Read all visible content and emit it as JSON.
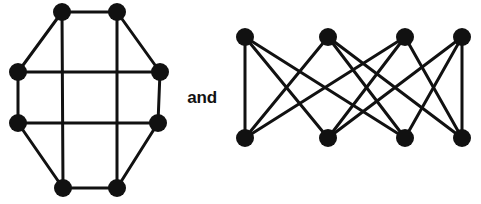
{
  "figure": {
    "caption_text": "and",
    "background_color": "#ffffff",
    "node_color": "#111111",
    "edge_color": "#111111",
    "node_radius": 9,
    "edge_width": 3
  },
  "chart_data": {
    "type": "diagram",
    "title": "",
    "subtitle": "",
    "xlabel": "",
    "ylabel": "",
    "graph_count": 2,
    "connector_label": "and",
    "graphs": [
      {
        "name": "octagon-grid-graph",
        "label": "left-graph",
        "description": "Regular octagon with four internal chords forming a grid; every vertex has degree 3",
        "vertex_count": 8,
        "edge_count": 12,
        "regular_degree": 3,
        "vertices": [
          {
            "id": "v1",
            "x": 62,
            "y": 12
          },
          {
            "id": "v2",
            "x": 117,
            "y": 12
          },
          {
            "id": "v3",
            "x": 160,
            "y": 72
          },
          {
            "id": "v4",
            "x": 158,
            "y": 123
          },
          {
            "id": "v5",
            "x": 117,
            "y": 188
          },
          {
            "id": "v6",
            "x": 63,
            "y": 188
          },
          {
            "id": "v7",
            "x": 18,
            "y": 123
          },
          {
            "id": "v8",
            "x": 18,
            "y": 72
          }
        ],
        "edges": [
          {
            "from": "v1",
            "to": "v2"
          },
          {
            "from": "v2",
            "to": "v3"
          },
          {
            "from": "v3",
            "to": "v4"
          },
          {
            "from": "v4",
            "to": "v5"
          },
          {
            "from": "v5",
            "to": "v6"
          },
          {
            "from": "v6",
            "to": "v7"
          },
          {
            "from": "v7",
            "to": "v8"
          },
          {
            "from": "v8",
            "to": "v1"
          },
          {
            "from": "v8",
            "to": "v3"
          },
          {
            "from": "v7",
            "to": "v4"
          },
          {
            "from": "v1",
            "to": "v6"
          },
          {
            "from": "v2",
            "to": "v5"
          }
        ]
      },
      {
        "name": "bipartite-cubic-graph",
        "label": "right-graph",
        "description": "Bipartite graph on 4 + 4 vertices with crossing edges; every vertex has degree 3",
        "vertex_count": 8,
        "edge_count": 12,
        "regular_degree": 3,
        "vertices": [
          {
            "id": "t1",
            "x": 245,
            "y": 37,
            "part": "top"
          },
          {
            "id": "t2",
            "x": 328,
            "y": 37,
            "part": "top"
          },
          {
            "id": "t3",
            "x": 405,
            "y": 37,
            "part": "top"
          },
          {
            "id": "t4",
            "x": 462,
            "y": 37,
            "part": "top"
          },
          {
            "id": "b1",
            "x": 245,
            "y": 138,
            "part": "bottom"
          },
          {
            "id": "b2",
            "x": 328,
            "y": 138,
            "part": "bottom"
          },
          {
            "id": "b3",
            "x": 405,
            "y": 138,
            "part": "bottom"
          },
          {
            "id": "b4",
            "x": 462,
            "y": 138,
            "part": "bottom"
          }
        ],
        "edges": [
          {
            "from": "t1",
            "to": "b1"
          },
          {
            "from": "t1",
            "to": "b2"
          },
          {
            "from": "t1",
            "to": "b3"
          },
          {
            "from": "t2",
            "to": "b1"
          },
          {
            "from": "t2",
            "to": "b3"
          },
          {
            "from": "t2",
            "to": "b4"
          },
          {
            "from": "t3",
            "to": "b1"
          },
          {
            "from": "t3",
            "to": "b2"
          },
          {
            "from": "t3",
            "to": "b4"
          },
          {
            "from": "t4",
            "to": "b2"
          },
          {
            "from": "t4",
            "to": "b3"
          },
          {
            "from": "t4",
            "to": "b4"
          }
        ]
      }
    ]
  }
}
